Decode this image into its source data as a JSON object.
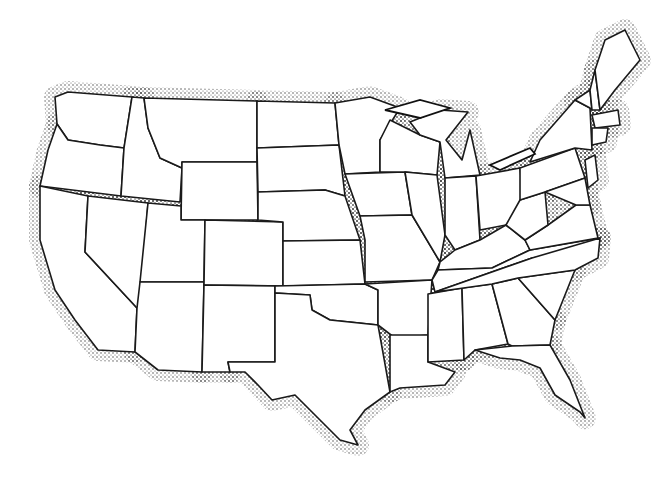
{
  "map": {
    "title": "",
    "description": "Blank outline map of the contiguous United States with stippled coastline shading",
    "colors": {
      "background": "#ffffff",
      "border": "#1a1a1a",
      "stipple": "#222222"
    },
    "labels": [],
    "states": [
      {
        "id": "WA",
        "points": "55,97 68,92 132,97 124,148 100,145 68,140 57,124"
      },
      {
        "id": "OR",
        "points": "57,124 68,140 100,145 124,148 121,196 40,186 48,150"
      },
      {
        "id": "CA",
        "points": "40,186 88,196 85,252 137,308 135,352 98,350 75,320 55,290 40,240"
      },
      {
        "id": "ID",
        "points": "132,97 144,98 148,128 160,158 182,168 180,202 121,196 124,148"
      },
      {
        "id": "NV",
        "points": "88,196 148,203 140,305 137,308 85,252"
      },
      {
        "id": "MT",
        "points": "144,98 257,101 257,162 182,162 182,168 160,158 148,128"
      },
      {
        "id": "WY",
        "points": "182,162 257,162 258,220 181,220"
      },
      {
        "id": "UT",
        "points": "148,203 181,206 181,220 205,220 204,282 140,282"
      },
      {
        "id": "AZ",
        "points": "140,282 204,282 202,372 158,370 135,352 137,308"
      },
      {
        "id": "CO",
        "points": "205,220 283,222 283,286 204,285"
      },
      {
        "id": "NM",
        "points": "204,285 275,286 275,362 228,362 230,372 202,372"
      },
      {
        "id": "ND",
        "points": "257,101 335,103 339,145 257,148"
      },
      {
        "id": "SD",
        "points": "257,148 339,145 345,196 325,190 258,192"
      },
      {
        "id": "NE",
        "points": "258,192 325,190 345,196 360,240 283,241 283,222 258,220"
      },
      {
        "id": "KS",
        "points": "283,241 360,240 365,284 283,286"
      },
      {
        "id": "OK",
        "points": "275,286 365,284 378,290 378,325 350,322 330,320 312,310 310,295 275,293"
      },
      {
        "id": "TX",
        "points": "275,293 310,295 312,310 330,320 378,325 390,392 365,410 350,430 358,445 340,440 310,410 295,395 272,400 258,385 245,372 230,372 228,362 275,362"
      },
      {
        "id": "MN",
        "points": "335,103 370,97 400,108 380,140 380,172 345,174 339,145"
      },
      {
        "id": "IA",
        "points": "345,174 405,172 412,215 360,216"
      },
      {
        "id": "MO",
        "points": "360,216 412,215 440,262 432,280 365,282 365,240"
      },
      {
        "id": "AR",
        "points": "365,284 432,280 428,335 395,338 378,325 378,290"
      },
      {
        "id": "LA",
        "points": "390,335 428,335 428,362 455,372 445,385 400,388 390,392"
      },
      {
        "id": "WI",
        "points": "380,140 390,120 420,135 440,142 437,175 405,172 380,172"
      },
      {
        "id": "IL",
        "points": "405,172 437,175 445,235 440,262 412,215"
      },
      {
        "id": "MI",
        "points": "410,122 440,110 468,112 446,140 462,160 470,130 480,175 445,178 440,142 420,135"
      },
      {
        "id": "IN",
        "points": "445,178 476,176 480,240 455,250 445,235"
      },
      {
        "id": "OH",
        "points": "476,176 520,168 525,215 506,225 480,230"
      },
      {
        "id": "KY",
        "points": "440,262 455,250 480,240 506,225 525,240 530,250 492,268 438,270"
      },
      {
        "id": "TN",
        "points": "432,280 438,270 492,268 530,250 600,238 585,250 532,258 435,292"
      },
      {
        "id": "MS",
        "points": "428,294 462,288 464,360 428,362 428,335"
      },
      {
        "id": "AL",
        "points": "462,288 492,284 508,344 475,350 464,360"
      },
      {
        "id": "GA",
        "points": "492,284 518,278 555,320 550,345 512,346 508,344"
      },
      {
        "id": "FL",
        "points": "475,350 512,346 550,345 570,380 585,418 580,412 555,395 540,368 520,360 500,358"
      },
      {
        "id": "SC",
        "points": "518,278 575,270 555,320"
      },
      {
        "id": "NC",
        "points": "532,258 600,238 598,258 575,270 518,278 492,284 435,292 532,258"
      },
      {
        "id": "VA",
        "points": "525,240 548,225 576,205 590,205 598,238 530,250"
      },
      {
        "id": "WV",
        "points": "506,225 520,200 545,192 548,225 525,240"
      },
      {
        "id": "PA",
        "points": "520,168 575,148 585,178 545,192 520,200"
      },
      {
        "id": "NY",
        "points": "530,162 540,140 575,100 590,108 592,150 575,148"
      },
      {
        "id": "VT",
        "points": "575,100 590,90 592,110 590,108"
      },
      {
        "id": "NH",
        "points": "590,90 595,70 600,110 592,110"
      },
      {
        "id": "ME",
        "points": "595,70 605,40 625,30 640,60 615,90 600,110"
      },
      {
        "id": "MA",
        "points": "592,115 618,110 620,125 595,128"
      },
      {
        "id": "CT",
        "points": "592,128 608,128 606,142 592,145"
      },
      {
        "id": "NJ",
        "points": "585,160 595,155 598,180 588,188"
      },
      {
        "id": "MD",
        "points": "545,192 585,178 590,205 576,205"
      }
    ],
    "lakes": [
      {
        "id": "superior",
        "points": "385,110 420,100 450,108 420,118"
      },
      {
        "id": "erie",
        "points": "490,165 530,148 535,154 500,170"
      }
    ]
  }
}
